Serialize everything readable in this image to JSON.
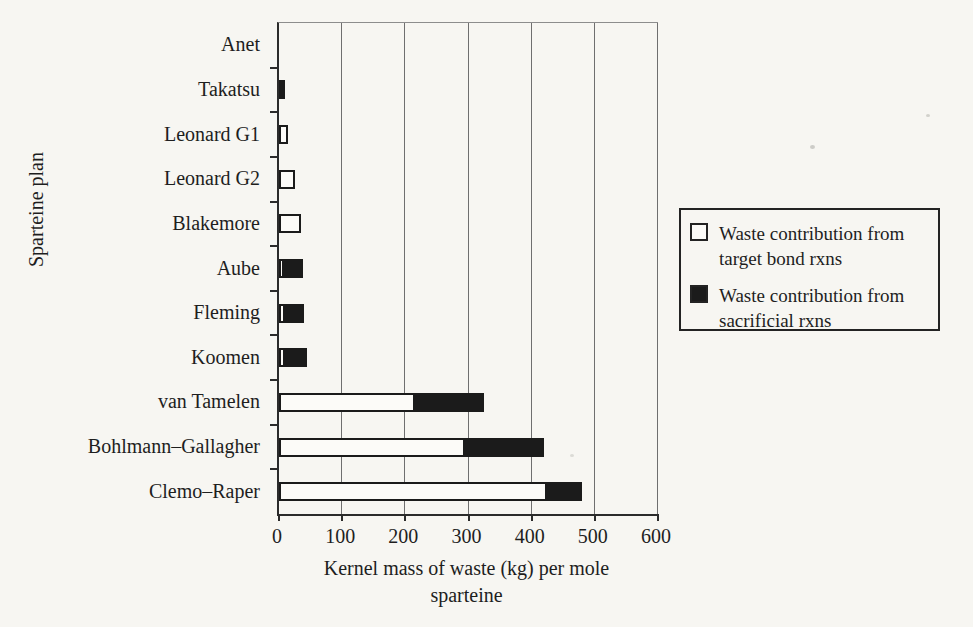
{
  "chart_data": {
    "type": "bar",
    "orientation": "horizontal",
    "stacked": true,
    "title": "",
    "xlabel": "Kernel mass of waste (kg) per mole sparteine",
    "ylabel": "Sparteine plan",
    "xlim": [
      0,
      600
    ],
    "xticks": [
      0,
      100,
      200,
      300,
      400,
      500,
      600
    ],
    "grid": "vertical",
    "legend_position": "right of plot",
    "categories": [
      "Anet",
      "Takatsu",
      "Leonard G1",
      "Leonard G2",
      "Blakemore",
      "Aube",
      "Fleming",
      "Koomen",
      "van Tamelen",
      "Bohlmann–Gallagher",
      "Clemo–Raper"
    ],
    "series": [
      {
        "name": "Waste contribution from target bond rxns",
        "color": "#fcfbf8",
        "values": [
          0,
          0,
          15,
          25,
          35,
          8,
          10,
          10,
          215,
          295,
          425
        ]
      },
      {
        "name": "Waste contribution from sacrificial rxns",
        "color": "#1b1b1b",
        "values": [
          0,
          10,
          0,
          0,
          0,
          30,
          30,
          35,
          110,
          125,
          55
        ]
      }
    ]
  },
  "axis": {
    "xlabel_line1": "Kernel mass of waste (kg) per mole",
    "xlabel_line2": "sparteine",
    "ylabel": "Sparteine plan"
  },
  "legend": {
    "items": [
      {
        "swatch": "white-square",
        "line1": "Waste contribution from",
        "line2": "target bond rxns"
      },
      {
        "swatch": "black-square",
        "line1": "Waste contribution from",
        "line2": "sacrificial rxns"
      }
    ]
  },
  "colors": {
    "background": "#f7f6f2",
    "bar_fill_target": "#fcfbf8",
    "bar_fill_sacrificial": "#1b1b1b",
    "axis": "#2b2b2b",
    "gridline": "#6f6f6f"
  }
}
